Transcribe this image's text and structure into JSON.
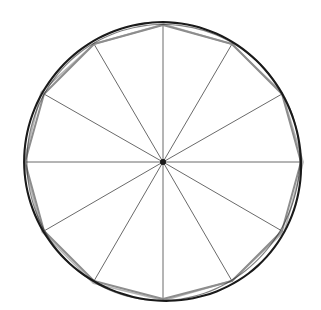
{
  "figure": {
    "title": "Circle with inscribed regular dodecagon and twelve radii",
    "background_color": "#ffffff",
    "canvas": {
      "width": 321,
      "height": 310
    }
  },
  "geometry": {
    "center": {
      "x": 163,
      "y": 162
    },
    "circle_radius": 139,
    "polygon_radius": 137,
    "polygon_sides": 12,
    "radii_count": 12,
    "start_angle_degrees": 90,
    "angle_step_degrees": 30,
    "vertex_angles_degrees": [
      90,
      120,
      150,
      180,
      210,
      240,
      270,
      300,
      330,
      0,
      30,
      60
    ],
    "vertices": [
      {
        "label": "top",
        "x": 163,
        "y": 25
      },
      {
        "label": "upper-left",
        "x": 94,
        "y": 44
      },
      {
        "label": "left-upper",
        "x": 44,
        "y": 94
      },
      {
        "label": "left",
        "x": 25,
        "y": 162
      },
      {
        "label": "left-lower",
        "x": 44,
        "y": 231
      },
      {
        "label": "lower-left",
        "x": 94,
        "y": 281
      },
      {
        "label": "bottom",
        "x": 163,
        "y": 299
      },
      {
        "label": "lower-right",
        "x": 232,
        "y": 281
      },
      {
        "label": "right-lower",
        "x": 282,
        "y": 231
      },
      {
        "label": "right",
        "x": 301,
        "y": 162
      },
      {
        "label": "right-upper",
        "x": 282,
        "y": 94
      },
      {
        "label": "upper-right",
        "x": 232,
        "y": 44
      }
    ]
  },
  "style": {
    "circle_stroke_color": "#1a1a1a",
    "circle_stroke_width": 2.1,
    "polygon_stroke_color": "#8d8d8d",
    "polygon_stroke_width": 2.0,
    "radius_stroke_color": "#6a6a6a",
    "radius_stroke_width": 1.0,
    "center_dot_color": "#1a1a1a",
    "center_dot_radius": 3
  },
  "labels": {
    "figure_caption": "",
    "notes": ""
  }
}
